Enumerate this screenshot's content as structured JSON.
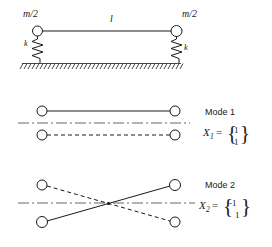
{
  "figure": {
    "background_color": "#ffffff",
    "line_color": "#1a1a1a",
    "centerline_color": "#555555"
  },
  "system": {
    "mass_left_label": "m/2",
    "mass_right_label": "m/2",
    "length_label": "l",
    "spring_left_label": "k",
    "spring_right_label": "k",
    "ground_hatching": "hatched-ground"
  },
  "modes": [
    {
      "title": "Mode 1",
      "variable": "X",
      "subscript": "1",
      "equals": "=",
      "vector": [
        "1",
        "1"
      ],
      "description": "in-phase mode, both masses move together",
      "upper_line_style": "solid",
      "lower_line_style": "dashed"
    },
    {
      "title": "Mode 2",
      "variable": "X",
      "subscript": "2",
      "equals": "=",
      "vector": [
        "-1",
        "1"
      ],
      "description": "out-of-phase mode, masses move opposite, lines cross",
      "upper_line_style": "crossing",
      "lower_line_style": "crossing"
    }
  ]
}
